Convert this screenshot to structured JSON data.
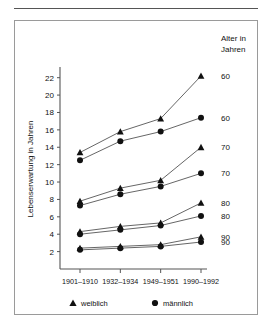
{
  "figure": {
    "corner_title_line1": "Alter in",
    "corner_title_line2": "Jahren"
  },
  "legend": {
    "position": "bottom",
    "entries": [
      {
        "marker": "triangle-marker-icon",
        "label": "weiblich"
      },
      {
        "marker": "circle-marker-icon",
        "label": "männlich"
      }
    ]
  },
  "chart_data": {
    "type": "line",
    "title": "",
    "subtitle": "",
    "xlabel": "",
    "ylabel": "Lebenserwartung in Jahren",
    "categories": [
      "1901–1910",
      "1932–1934",
      "1949–1951",
      "1990–1992"
    ],
    "ylim": [
      0,
      23
    ],
    "yticks": [
      2,
      4,
      6,
      8,
      10,
      12,
      14,
      16,
      18,
      20,
      22
    ],
    "ytick_labels": [
      "2",
      "4",
      "6",
      "8",
      "10",
      "12",
      "14",
      "16",
      "18",
      "20",
      "22"
    ],
    "grid": false,
    "legend_position": "bottom",
    "annotations": [
      "Alter in Jahren"
    ],
    "right_axis_labels": [
      "60",
      "60",
      "70",
      "70",
      "80",
      "80",
      "90",
      "90"
    ],
    "series": [
      {
        "name": "weiblich 60",
        "sex": "weiblich",
        "age": "60",
        "marker": "triangle",
        "right_label": "60",
        "values": [
          13.4,
          15.8,
          17.3,
          22.2
        ]
      },
      {
        "name": "männlich 60",
        "sex": "männlich",
        "age": "60",
        "marker": "circle",
        "right_label": "60",
        "values": [
          12.5,
          14.7,
          15.8,
          17.4
        ]
      },
      {
        "name": "weiblich 70",
        "sex": "weiblich",
        "age": "70",
        "marker": "triangle",
        "right_label": "70",
        "values": [
          7.8,
          9.3,
          10.2,
          14.0
        ]
      },
      {
        "name": "männlich 70",
        "sex": "männlich",
        "age": "70",
        "marker": "circle",
        "right_label": "70",
        "values": [
          7.3,
          8.6,
          9.5,
          11.0
        ]
      },
      {
        "name": "weiblich 80",
        "sex": "weiblich",
        "age": "80",
        "marker": "triangle",
        "right_label": "80",
        "values": [
          4.3,
          4.9,
          5.3,
          7.6
        ]
      },
      {
        "name": "männlich 80",
        "sex": "männlich",
        "age": "80",
        "marker": "circle",
        "right_label": "80",
        "values": [
          4.0,
          4.5,
          5.0,
          6.1
        ]
      },
      {
        "name": "weiblich 90",
        "sex": "weiblich",
        "age": "90",
        "marker": "triangle",
        "right_label": "90",
        "values": [
          2.4,
          2.6,
          2.8,
          3.7
        ]
      },
      {
        "name": "männlich 90",
        "sex": "männlich",
        "age": "90",
        "marker": "circle",
        "right_label": "90",
        "values": [
          2.2,
          2.4,
          2.6,
          3.1
        ]
      }
    ],
    "colors": {
      "marker": "#111111",
      "line": "#555555",
      "axis": "#555555"
    }
  }
}
